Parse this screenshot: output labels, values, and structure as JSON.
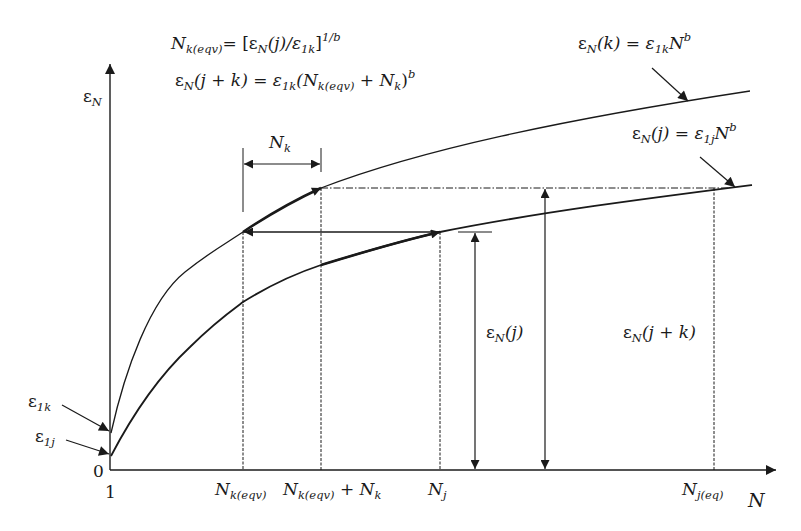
{
  "figure": {
    "type": "fatigue-strain-accumulation-diagram",
    "line_color": "#1a1a1a",
    "background": "#ffffff"
  },
  "equations": {
    "eq1": {
      "lhs": "N",
      "lhs_sub": "k(eqv)",
      "rhs_a": "= [ε",
      "rhs_a_sub": "N",
      "rhs_b": "(j)/ε",
      "rhs_b_sub": "1k",
      "rhs_c": "]",
      "rhs_sup": "1/b"
    },
    "eq2": {
      "lhs": "ε",
      "lhs_sub": "N",
      "lhs_b": "(j + k) = ε",
      "lhs_b_sub": "1k",
      "rhs_a": "(N",
      "rhs_a_sub": "k(eqv)",
      "rhs_b": " + N",
      "rhs_b_sub": "k",
      "rhs_c": ")",
      "rhs_sup": "b"
    }
  },
  "curve_labels": {
    "upper": {
      "a": "ε",
      "a_sub": "N",
      "b": "(k) = ε",
      "b_sub": "1k",
      "c": "N",
      "c_sup": "b"
    },
    "lower": {
      "a": "ε",
      "a_sub": "N",
      "b": "(j) = ε",
      "b_sub": "1j",
      "c": "N",
      "c_sup": "b"
    }
  },
  "axes": {
    "y_label": "ε",
    "y_label_sub": "N",
    "x_label": "N",
    "origin": "0",
    "x_start": "1",
    "y_intercepts": [
      {
        "text": "ε",
        "sub": "1k"
      },
      {
        "text": "ε",
        "sub": "1j"
      }
    ]
  },
  "x_ticks": [
    {
      "text": "N",
      "sub": "k(eqv)",
      "suffix": "",
      "suffix_sub": ""
    },
    {
      "text": "N",
      "sub": "k(eqv)",
      "suffix": " + N",
      "suffix_sub": "k"
    },
    {
      "text": "N",
      "sub": "j",
      "suffix": "",
      "suffix_sub": ""
    },
    {
      "text": "N",
      "sub": "j(eq)",
      "suffix": "",
      "suffix_sub": ""
    }
  ],
  "dimensions": {
    "nk": {
      "text": "N",
      "sub": "k"
    },
    "eps_j": {
      "text": "ε",
      "sub": "N",
      "suffix": "(j)"
    },
    "eps_jk": {
      "text": "ε",
      "sub": "N",
      "suffix": "(j + k)"
    }
  }
}
